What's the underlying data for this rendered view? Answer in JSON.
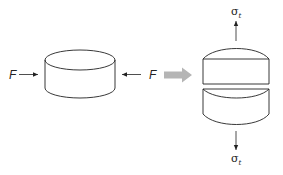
{
  "diagram": {
    "left_force_label": "F",
    "right_force_label": "F",
    "top_stress_label": "σ",
    "top_stress_sub": "t",
    "bottom_stress_label": "σ",
    "bottom_stress_sub": "t",
    "colors": {
      "stroke": "#222222",
      "transition_arrow": "#b5b5b5",
      "background": "#ffffff"
    },
    "elements": [
      "compressed-cylinder",
      "compression-force-left",
      "compression-force-right",
      "transition-arrow",
      "split-cylinder-top-half",
      "split-cylinder-bottom-half",
      "tensile-stress-up",
      "tensile-stress-down"
    ]
  }
}
